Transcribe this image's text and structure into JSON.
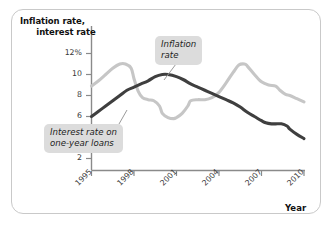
{
  "figure": {
    "frame_border_color": "#c9c9c9",
    "background": "#ffffff"
  },
  "chart_data": {
    "type": "line",
    "title": "",
    "xlabel": "Year",
    "ylabel": "Inflation rate, interest rate",
    "ylabel_line1": "Inflation rate,",
    "ylabel_line2": "interest rate",
    "xlim": [
      1995,
      2010
    ],
    "ylim": [
      0,
      13
    ],
    "grid": false,
    "legend_position": "inline-callouts",
    "yticks": [
      {
        "value": 12,
        "label": "12%"
      },
      {
        "value": 10,
        "label": "10"
      },
      {
        "value": 8,
        "label": "8"
      },
      {
        "value": 6,
        "label": "6"
      },
      {
        "value": 4,
        "label": "4"
      },
      {
        "value": 2,
        "label": "2"
      }
    ],
    "xticks": [
      {
        "value": 1995,
        "label": "1995"
      },
      {
        "value": 1998,
        "label": "1998"
      },
      {
        "value": 2001,
        "label": "2001"
      },
      {
        "value": 2004,
        "label": "2004"
      },
      {
        "value": 2007,
        "label": "2007"
      },
      {
        "value": 2010,
        "label": "2010"
      }
    ],
    "series": [
      {
        "name": "Inflation rate",
        "color": "#3f3f3f",
        "linewidth": 3.1,
        "x": [
          1995,
          1995.5,
          1996,
          1996.5,
          1997,
          1997.5,
          1998,
          1998.5,
          1999,
          1999.5,
          2000,
          2000.4,
          2001,
          2001.5,
          2002,
          2002.5,
          2003,
          2003.5,
          2004,
          2004.5,
          2005,
          2005.5,
          2006,
          2006.5,
          2007,
          2007.3,
          2007.7,
          2008,
          2008.4,
          2008.8,
          2009,
          2009.5,
          2010
        ],
        "y": [
          6.0,
          6.5,
          7.0,
          7.5,
          8.0,
          8.5,
          8.8,
          9.1,
          9.4,
          9.8,
          10.0,
          10.0,
          9.8,
          9.5,
          9.1,
          8.8,
          8.5,
          8.2,
          7.9,
          7.6,
          7.3,
          6.9,
          6.4,
          6.0,
          5.6,
          5.4,
          5.3,
          5.3,
          5.3,
          5.1,
          4.8,
          4.3,
          3.9
        ]
      },
      {
        "name": "Interest rate on one-year loans",
        "color": "#c6c6c6",
        "linewidth": 3.1,
        "x": [
          1995,
          1995.5,
          1996,
          1996.5,
          1997,
          1997.4,
          1997.8,
          1998,
          1998.3,
          1998.6,
          1999,
          1999.4,
          1999.8,
          2000,
          2000.4,
          2000.8,
          2001,
          2001.4,
          2001.8,
          2002,
          2002.5,
          2003,
          2003.5,
          2004,
          2004.5,
          2005,
          2005.4,
          2005.8,
          2006,
          2006.5,
          2007,
          2007.5,
          2008,
          2008.3,
          2008.7,
          2009,
          2009.5,
          2010
        ],
        "y": [
          8.9,
          9.4,
          10.0,
          10.6,
          11.0,
          11.0,
          10.6,
          9.6,
          8.4,
          7.8,
          7.6,
          7.5,
          7.0,
          6.3,
          5.9,
          5.8,
          5.9,
          6.3,
          7.0,
          7.5,
          7.6,
          7.6,
          7.8,
          8.3,
          9.2,
          10.2,
          10.9,
          11.0,
          10.8,
          10.0,
          9.3,
          9.0,
          8.9,
          8.5,
          8.1,
          8.0,
          7.7,
          7.4
        ]
      }
    ],
    "annotations": [
      {
        "id": "inflation",
        "text_line1": "Inflation",
        "text_line2": "rate",
        "target_series": "Inflation rate"
      },
      {
        "id": "interest",
        "text_line1": "Interest rate on",
        "text_line2": "one-year loans",
        "target_series": "Interest rate on one-year loans"
      }
    ]
  }
}
